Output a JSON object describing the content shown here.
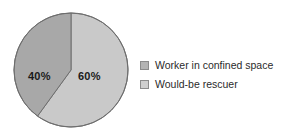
{
  "chart_data": {
    "type": "pie",
    "title": "",
    "categories": [
      "Worker in confined space",
      "Would-be rescuer"
    ],
    "values": [
      60,
      40
    ],
    "data_labels": [
      "60%",
      "40%"
    ],
    "colors": [
      "#c9c9c9",
      "#a8a8a8"
    ],
    "stroke_color": "#6e6e6e",
    "start_angle_deg": 0,
    "direction": "clockwise",
    "legend_position": "right",
    "grid": false,
    "xlabel": "",
    "ylabel": ""
  },
  "legend": {
    "items": [
      {
        "label": "Worker in confined space",
        "color": "#b4b4b4"
      },
      {
        "label": "Would-be rescuer",
        "color": "#cfcfcf"
      }
    ]
  },
  "pie": {
    "slices": [
      {
        "name": "Worker in confined space",
        "label": "60%",
        "value": 60,
        "color": "#c9c9c9"
      },
      {
        "name": "Would-be rescuer",
        "label": "40%",
        "value": 40,
        "color": "#a8a8a8"
      }
    ]
  }
}
